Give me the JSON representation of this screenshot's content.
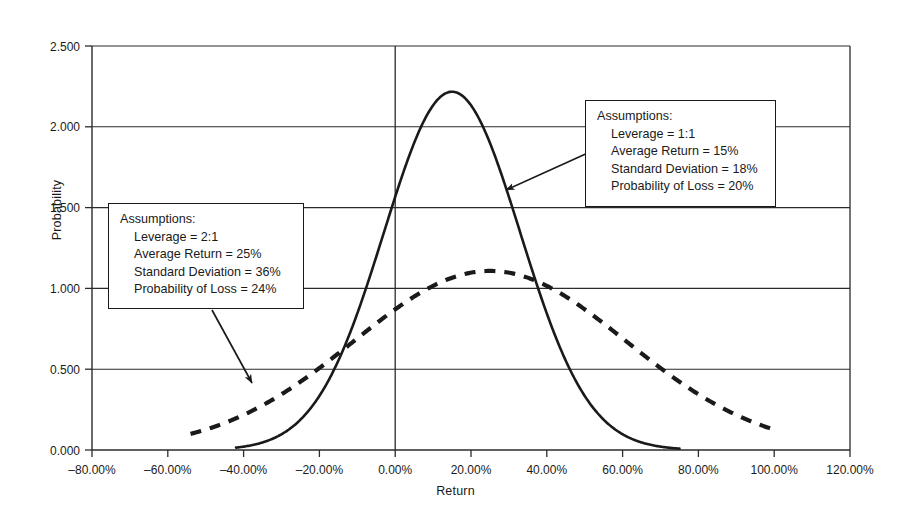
{
  "chart_data": {
    "type": "line",
    "title": "",
    "xlabel": "Return",
    "ylabel": "Probability",
    "xlim": [
      -80,
      120
    ],
    "ylim": [
      0.0,
      2.5
    ],
    "grid": true,
    "legend": "none",
    "x_ticks": [
      "–80.00%",
      "–60.00%",
      "–40.00%",
      "–20.00%",
      "0.00%",
      "20.00%",
      "40.00%",
      "60.00%",
      "80.00%",
      "100.00%",
      "120.00%"
    ],
    "x_tick_values": [
      -80,
      -60,
      -40,
      -20,
      0,
      20,
      40,
      60,
      80,
      100,
      120
    ],
    "y_ticks": [
      "0.000",
      "0.500",
      "1.000",
      "1.500",
      "2.000",
      "2.500"
    ],
    "y_tick_values": [
      0.0,
      0.5,
      1.0,
      1.5,
      2.0,
      2.5
    ],
    "series": [
      {
        "name": "Leverage 1:1 normal distribution",
        "style": "solid",
        "mean": 15,
        "std_dev": 18,
        "peak_probability": 2.217,
        "x_start": -42,
        "x_end": 75,
        "color": "#1a1a1a"
      },
      {
        "name": "Leverage 2:1 normal distribution",
        "style": "dashed",
        "mean": 25,
        "std_dev": 36,
        "peak_probability": 1.108,
        "x_start": -54,
        "x_end": 99,
        "color": "#1a1a1a"
      }
    ]
  },
  "annotations": [
    {
      "id": "anno-1",
      "header": "Assumptions:",
      "lines": [
        "Leverage = 1:1",
        "Average Return = 15%",
        "Standard Deviation = 18%",
        "Probability of Loss = 20%"
      ],
      "arrow_from": [
        590,
        152
      ],
      "arrow_to": [
        506,
        190
      ]
    },
    {
      "id": "anno-2",
      "header": "Assumptions:",
      "lines": [
        "Leverage = 2:1",
        "Average Return = 25%",
        "Standard Deviation = 36%",
        "Probability of Loss = 24%"
      ],
      "arrow_from": [
        212,
        310
      ],
      "arrow_to": [
        252,
        383
      ]
    }
  ]
}
